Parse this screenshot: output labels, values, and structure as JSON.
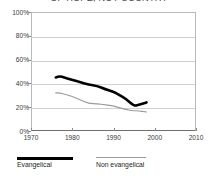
{
  "chart_data": {
    "type": "line",
    "title": "OF HOPE, NOT COUNTRY",
    "xlabel": "",
    "ylabel": "",
    "xlim": [
      1970,
      2010
    ],
    "ylim": [
      0,
      100
    ],
    "grid": true,
    "legend_position": "bottom-left",
    "y_ticks": [
      0,
      20,
      40,
      60,
      80,
      100
    ],
    "y_tick_labels": [
      "0%",
      "20%",
      "40%",
      "60%",
      "80%",
      "100%"
    ],
    "x_ticks": [
      1970,
      1980,
      1990,
      2000,
      2010
    ],
    "x_tick_labels": [
      "1970",
      "1980",
      "1990",
      "2000",
      "2010"
    ],
    "series": [
      {
        "name": "Evangelical",
        "color": "#000000",
        "line_width": 2.6,
        "x": [
          1976,
          1977,
          1978,
          1980,
          1982,
          1984,
          1986,
          1988,
          1990,
          1991,
          1993,
          1995,
          1996,
          1998
        ],
        "values": [
          45,
          46,
          45,
          43,
          41,
          39,
          38,
          35,
          33,
          31,
          27,
          21,
          22,
          24
        ]
      },
      {
        "name": "Non evangelical",
        "color": "#9a9a9a",
        "line_width": 1.1,
        "x": [
          1976,
          1977,
          1978,
          1980,
          1982,
          1984,
          1986,
          1988,
          1990,
          1991,
          1993,
          1995,
          1996,
          1998
        ],
        "values": [
          32,
          32,
          31,
          29,
          26,
          23,
          23,
          22,
          21,
          20,
          18,
          17,
          17,
          16
        ]
      }
    ]
  },
  "legend": {
    "items": [
      {
        "label": "Evangelical",
        "color": "#000000",
        "style": "thick"
      },
      {
        "label": "Non evangelical",
        "color": "#9a9a9a",
        "style": "thin"
      }
    ]
  }
}
